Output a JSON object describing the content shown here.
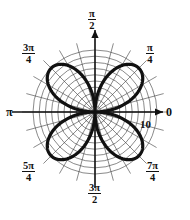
{
  "figure": {
    "kind": "polar-rose-plot",
    "background_color": "#ffffff",
    "curve_color": "#111111",
    "grid_color": "#444444",
    "axis_color": "#111111"
  },
  "axes": {
    "center_x": 95,
    "center_y": 112,
    "max_radius_px": 62,
    "radial_tick_label": "10",
    "angle_labels": [
      {
        "name": "angle-0",
        "text": "0",
        "type": "plain",
        "numerator": "",
        "denominator": ""
      },
      {
        "name": "angle-pi-4",
        "text": "π/4",
        "type": "fraction",
        "numerator": "π",
        "denominator": "4"
      },
      {
        "name": "angle-pi-2",
        "text": "π/2",
        "type": "fraction",
        "numerator": "π",
        "denominator": "2"
      },
      {
        "name": "angle-3pi-4",
        "text": "3π/4",
        "type": "fraction",
        "numerator": "3π",
        "denominator": "4"
      },
      {
        "name": "angle-pi",
        "text": "π",
        "type": "plain",
        "numerator": "",
        "denominator": ""
      },
      {
        "name": "angle-5pi-4",
        "text": "5π/4",
        "type": "fraction",
        "numerator": "5π",
        "denominator": "4"
      },
      {
        "name": "angle-3pi-2",
        "text": "3π/2",
        "type": "fraction",
        "numerator": "3π",
        "denominator": "2"
      },
      {
        "name": "angle-7pi-4",
        "text": "7π/4",
        "type": "fraction",
        "numerator": "7π",
        "denominator": "4"
      }
    ]
  },
  "chart_data": {
    "type": "line",
    "plot_system": "polar",
    "title": "",
    "subtitle": "",
    "xlabel": "",
    "ylabel": "",
    "grid": true,
    "legend": null,
    "legend_position": "none",
    "rlim": [
      0,
      10
    ],
    "r_ticks": [
      1,
      2,
      3,
      4,
      5,
      6,
      7,
      8,
      9,
      10
    ],
    "r_tick_labels_shown": [
      "10"
    ],
    "theta_lim_deg": [
      0,
      360
    ],
    "theta_ticks_deg": [
      0,
      45,
      90,
      135,
      180,
      225,
      270,
      315
    ],
    "theta_tick_labels": [
      "0",
      "π/4",
      "π/2",
      "3π/4",
      "π",
      "5π/4",
      "3π/2",
      "7π/4"
    ],
    "grid_circle_count": 10,
    "grid_spoke_count": 24,
    "grid_spoke_step_deg": 15,
    "series": [
      {
        "name": "r = 10 sin(2θ)",
        "equation": "r = 10 sin(2θ)",
        "petal_count": 4,
        "amplitude": 10,
        "petal_center_angles_deg": [
          45,
          135,
          225,
          315
        ],
        "points_theta_deg": [
          0,
          10,
          20,
          30,
          40,
          45,
          50,
          60,
          70,
          80,
          90,
          100,
          110,
          120,
          130,
          135,
          140,
          150,
          160,
          170,
          180,
          190,
          200,
          210,
          220,
          225,
          230,
          240,
          250,
          260,
          270,
          280,
          290,
          300,
          310,
          315,
          320,
          330,
          340,
          350,
          360
        ],
        "points_r": [
          0,
          3.42,
          6.43,
          8.66,
          9.85,
          10,
          9.85,
          8.66,
          6.43,
          3.42,
          0,
          3.42,
          6.43,
          8.66,
          9.85,
          10,
          9.85,
          8.66,
          6.43,
          3.42,
          0,
          3.42,
          6.43,
          8.66,
          9.85,
          10,
          9.85,
          8.66,
          6.43,
          3.42,
          0,
          3.42,
          6.43,
          8.66,
          9.85,
          10,
          9.85,
          8.66,
          6.43,
          3.42,
          0
        ]
      }
    ],
    "annotations": [
      {
        "name": "radial-tick-10",
        "text": "10",
        "theta_deg": 0,
        "r": 10
      }
    ]
  }
}
